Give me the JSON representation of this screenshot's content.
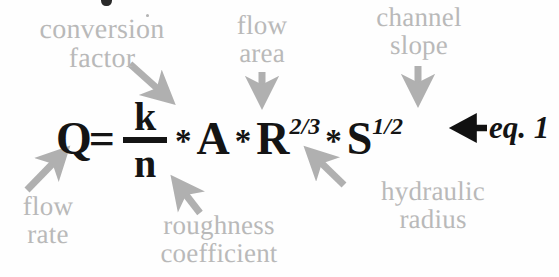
{
  "figure": {
    "type": "annotated-equation-diagram",
    "caption_ref": "eq. 1",
    "equation_plain": "Q = (k/n) * A * R^2/3 * S^1/2",
    "name": "Manning's equation"
  },
  "equation": {
    "q": "Q",
    "equals": "=",
    "numerator": "k",
    "denominator": "n",
    "mult1": "*",
    "area": "A",
    "mult2": "*",
    "radius": "R",
    "radius_exponent": "2/3",
    "mult3": "*",
    "slope": "S",
    "slope_exponent": "1/2",
    "eq_ref": "eq. 1"
  },
  "labels": {
    "conversion_factor": "conversion\nfactor",
    "flow_area": "flow\narea",
    "channel_slope": "channel\nslope",
    "flow_rate": "flow\nrate",
    "roughness_coefficient": "roughness\ncoefficient",
    "hydraulic_radius": "hydraulic\nradius"
  },
  "colors": {
    "label_gray": "#b9b9b9",
    "arrow_gray": "#b0b0b0",
    "equation_black": "#141414",
    "background": "#fefefe"
  }
}
